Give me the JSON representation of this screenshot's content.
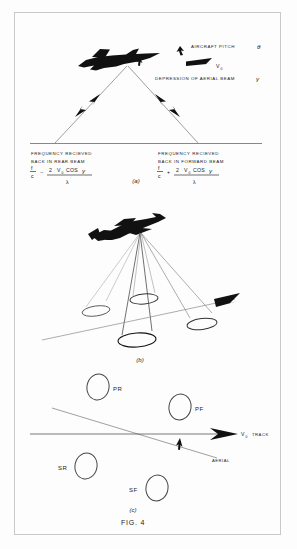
{
  "figure": {
    "caption": "FIG. 4",
    "border_color": "#c8c8c8",
    "ink_color": "#111111",
    "line_color": "#555555"
  },
  "panel_a": {
    "label": "(a)",
    "annotations": {
      "pitch": "AIRCRAFT   PITCH",
      "pitch_symbol": "θ",
      "velocity_symbol": "V",
      "velocity_sub": "0",
      "depression": "DEPRESSION   OF   AERIAL   BEAM",
      "depression_symbol": "γ"
    },
    "rear_beam": {
      "line1": "FREQUENCY   RECIEVED",
      "line2": "BACK   IN   REAR   BEAM",
      "numerator_f": "f",
      "numerator_c": "c",
      "operator": "−",
      "term_coeff": "2",
      "term_v": "V",
      "term_v_sub": "0",
      "term_cos": "COS",
      "term_gamma": "γ",
      "denominator": "λ"
    },
    "forward_beam": {
      "line1": "FREQUENCY   RECIEVED",
      "line2": "BACK   IN   FORWARD   BEAM",
      "numerator_f": "f",
      "numerator_c": "c",
      "operator": "+",
      "term_coeff": "2",
      "term_v": "V",
      "term_v_sub": "0",
      "term_cos": "COS",
      "term_gamma": "γ",
      "denominator": "λ"
    }
  },
  "panel_b": {
    "label": "(b)",
    "beam_count": 4
  },
  "panel_c": {
    "label": "(c)",
    "track_label": "TRACK",
    "track_velocity": "V",
    "track_velocity_sub": "0",
    "aerial_label": "AERIAL",
    "spots": [
      {
        "id": "PR",
        "label": "PR",
        "cx": 98,
        "cy": 387,
        "rx": 11,
        "ry": 13
      },
      {
        "id": "PF",
        "label": "PF",
        "cx": 180,
        "cy": 407,
        "rx": 11,
        "ry": 13
      },
      {
        "id": "SR",
        "label": "SR",
        "cx": 86,
        "cy": 466,
        "rx": 11,
        "ry": 13
      },
      {
        "id": "SF",
        "label": "SF",
        "cx": 157,
        "cy": 488,
        "rx": 11,
        "ry": 13
      }
    ]
  }
}
